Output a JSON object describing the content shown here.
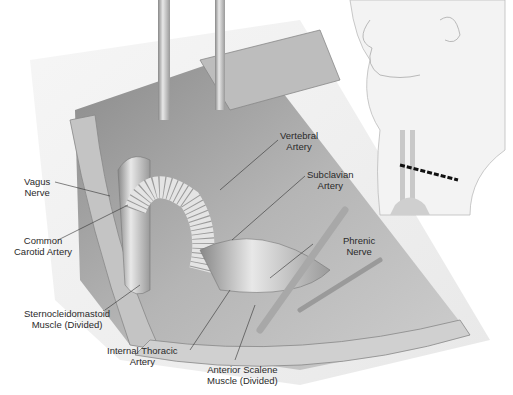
{
  "figure": {
    "type": "surgical-anatomy-illustration",
    "main_view": "Left supraclavicular exposure, carotid-subclavian bypass with ringed graft",
    "inset_view": "Head and neck profile with dashed supraclavicular incision line"
  },
  "labels": {
    "vagus_nerve": {
      "line1": "Vagus",
      "line2": "Nerve"
    },
    "common_carotid": {
      "line1": "Common",
      "line2": "Carotid Artery"
    },
    "scm": {
      "line1": "Sternocleidomastoid",
      "line2": "Muscle (Divided)"
    },
    "internal_thoracic": {
      "line1": "Internal Thoracic",
      "line2": "Artery"
    },
    "anterior_scalene": {
      "line1": "Anterior Scalene",
      "line2": "Muscle (Divided)"
    },
    "vertebral": {
      "line1": "Vertebral",
      "line2": "Artery"
    },
    "subclavian": {
      "line1": "Subclavian",
      "line2": "Artery"
    },
    "phrenic": {
      "line1": "Phrenic",
      "line2": "Nerve"
    }
  },
  "colors": {
    "line": "#333333",
    "tissue_dark": "#9a9a9a",
    "tissue_light": "#d8d8d8",
    "incision": "#111111"
  }
}
